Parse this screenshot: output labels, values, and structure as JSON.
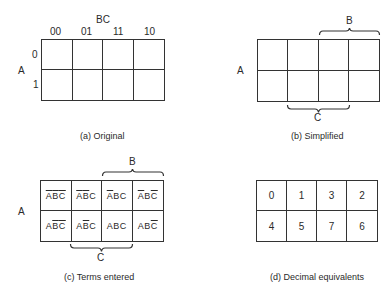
{
  "panel_a": {
    "var_col": "BC",
    "col_headers": [
      "00",
      "01",
      "11",
      "10"
    ],
    "var_row": "A",
    "row_headers": [
      "0",
      "1"
    ],
    "caption": "(a) Original"
  },
  "panel_b": {
    "var_row": "A",
    "brace_top": "B",
    "brace_bottom": "C",
    "caption": "(b) Simplified"
  },
  "panel_c": {
    "var_row": "A",
    "brace_top": "B",
    "brace_bottom": "C",
    "cells": [
      [
        {
          "a": "A",
          "a_bar": true,
          "b": "B",
          "b_bar": true,
          "c": "C",
          "c_bar": true
        },
        {
          "a": "A",
          "a_bar": true,
          "b": "B",
          "b_bar": true,
          "c": "C",
          "c_bar": false
        },
        {
          "a": "A",
          "a_bar": true,
          "b": "B",
          "b_bar": false,
          "c": "C",
          "c_bar": false
        },
        {
          "a": "A",
          "a_bar": true,
          "b": "B",
          "b_bar": false,
          "c": "C",
          "c_bar": true
        }
      ],
      [
        {
          "a": "A",
          "a_bar": false,
          "b": "B",
          "b_bar": true,
          "c": "C",
          "c_bar": true
        },
        {
          "a": "A",
          "a_bar": false,
          "b": "B",
          "b_bar": true,
          "c": "C",
          "c_bar": false
        },
        {
          "a": "A",
          "a_bar": false,
          "b": "B",
          "b_bar": false,
          "c": "C",
          "c_bar": false
        },
        {
          "a": "A",
          "a_bar": false,
          "b": "B",
          "b_bar": false,
          "c": "C",
          "c_bar": true
        }
      ]
    ],
    "caption": "(c) Terms entered"
  },
  "panel_d": {
    "cells": [
      [
        "0",
        "1",
        "3",
        "2"
      ],
      [
        "4",
        "5",
        "7",
        "6"
      ]
    ],
    "caption": "(d) Decimal equivalents"
  }
}
